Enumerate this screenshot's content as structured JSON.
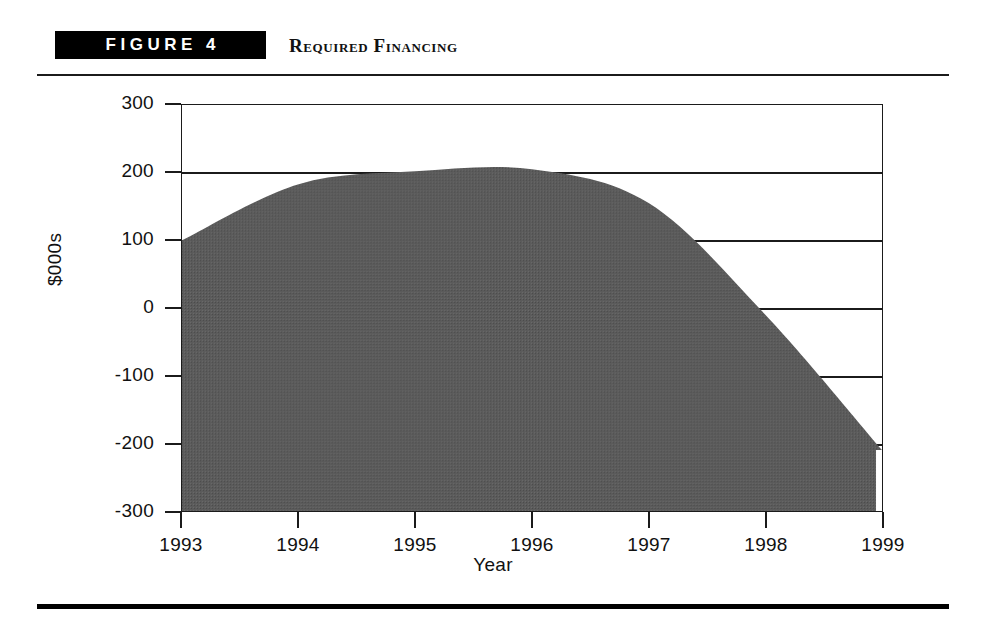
{
  "header": {
    "badge_label": "FIGURE 4",
    "title": "Required Financing"
  },
  "chart_data": {
    "type": "area",
    "title": "Required Financing",
    "xlabel": "Year",
    "ylabel": "$000s",
    "categories": [
      "1993",
      "1994",
      "1995",
      "1996",
      "1997",
      "1998",
      "1999"
    ],
    "x": [
      1993,
      1994,
      1995,
      1996,
      1997,
      1998,
      1999
    ],
    "values": [
      100,
      183,
      202,
      205,
      155,
      -10,
      -210
    ],
    "ylim": [
      -300,
      300
    ],
    "xlim": [
      1993,
      1999
    ],
    "yticks": [
      300,
      200,
      100,
      0,
      -100,
      -200,
      -300
    ],
    "xticks": [
      "1993",
      "1994",
      "1995",
      "1996",
      "1997",
      "1998",
      "1999"
    ],
    "grid": true,
    "legend": false,
    "series": [
      {
        "name": "Required Financing",
        "values": [
          100,
          183,
          202,
          205,
          155,
          -10,
          -210
        ],
        "fill_color": "#5b5b5b",
        "baseline": -300
      }
    ],
    "colors": {
      "area_fill": "#5b5b5b",
      "axis": "#1b1b1b",
      "background": "#ffffff"
    }
  }
}
